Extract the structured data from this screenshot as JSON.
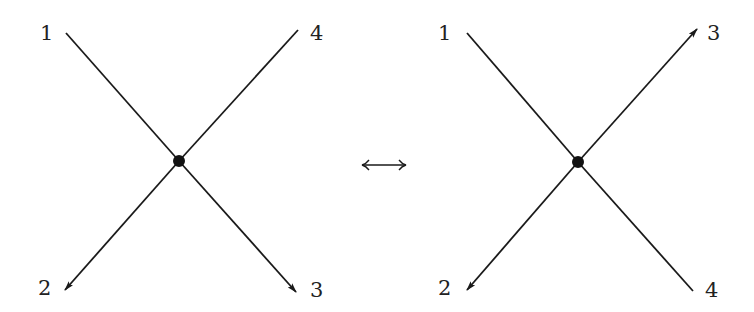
{
  "figure": {
    "colors": {
      "line": "#1a1a1a",
      "vertex": "#111111",
      "label": "#222222",
      "background": "#ffffff"
    },
    "left_diagram": {
      "vertex": {
        "x": 179,
        "y": 161
      },
      "legs": [
        {
          "id": "1",
          "label": "1",
          "from": [
            66,
            33
          ],
          "to": [
            179,
            161
          ],
          "arrow": false,
          "label_pos": [
            45,
            40
          ]
        },
        {
          "id": "2",
          "label": "2",
          "from": [
            179,
            161
          ],
          "to": [
            65,
            290
          ],
          "arrow": true,
          "label_pos": [
            43,
            295
          ]
        },
        {
          "id": "3",
          "label": "3",
          "from": [
            179,
            161
          ],
          "to": [
            296,
            292
          ],
          "arrow": true,
          "label_pos": [
            311,
            297
          ]
        },
        {
          "id": "4",
          "label": "4",
          "from": [
            298,
            30
          ],
          "to": [
            179,
            161
          ],
          "arrow": false,
          "label_pos": [
            311,
            40
          ]
        }
      ]
    },
    "relation": {
      "symbol": "⟷",
      "name": "double-headed-arrow",
      "from": [
        362,
        165
      ],
      "to": [
        406,
        165
      ]
    },
    "right_diagram": {
      "vertex": {
        "x": 578,
        "y": 162
      },
      "legs": [
        {
          "id": "1",
          "label": "1",
          "from": [
            467,
            33
          ],
          "to": [
            578,
            162
          ],
          "arrow": false,
          "label_pos": [
            440,
            40
          ]
        },
        {
          "id": "2",
          "label": "2",
          "from": [
            578,
            162
          ],
          "to": [
            467,
            290
          ],
          "arrow": true,
          "label_pos": [
            440,
            295
          ]
        },
        {
          "id": "3",
          "label": "3",
          "from": [
            578,
            162
          ],
          "to": [
            697,
            29
          ],
          "arrow": true,
          "label_pos": [
            708,
            40
          ]
        },
        {
          "id": "4",
          "label": "4",
          "from": [
            693,
            291
          ],
          "to": [
            578,
            162
          ],
          "arrow": false,
          "label_pos": [
            708,
            297
          ]
        }
      ]
    }
  }
}
